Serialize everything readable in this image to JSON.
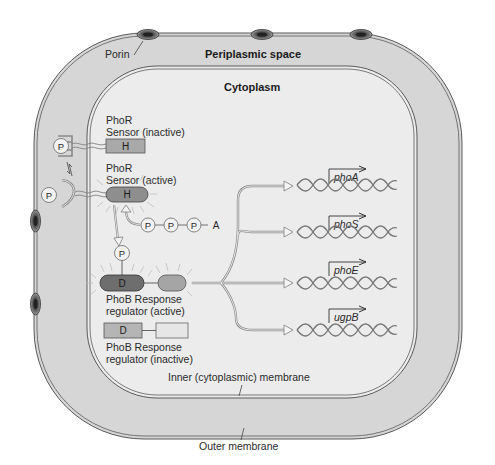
{
  "regions": {
    "periplasm_label": "Periplasmic space",
    "cytoplasm_label": "Cytoplasm",
    "porin_label": "Porin",
    "inner_membrane_label": "Inner (cytoplasmic) membrane",
    "outer_membrane_label": "Outer membrane"
  },
  "sensor_inactive": {
    "line1": "PhoR",
    "line2": "Sensor (inactive)",
    "domain": "H",
    "ligand": "P"
  },
  "sensor_active": {
    "line1": "PhoR",
    "line2": "Sensor (active)",
    "domain": "H",
    "ligand": "P"
  },
  "atp": {
    "p1": "P",
    "p2": "P",
    "p3": "P",
    "a": "A"
  },
  "regulator_active": {
    "phosphate": "P",
    "domain": "D",
    "line1": "PhoB Response",
    "line2": "regulator (active)"
  },
  "regulator_inactive": {
    "domain": "D",
    "line1": "PhoB Response",
    "line2": "regulator (inactive)"
  },
  "genes": [
    {
      "name": "phoA"
    },
    {
      "name": "phoS"
    },
    {
      "name": "phoE"
    },
    {
      "name": "ugpB"
    }
  ],
  "colors": {
    "periplasm": "#d6d6d6",
    "cytoplasm": "#ececec",
    "membrane_line": "#5a5a5a",
    "sensor_inactive_fill": "#a9a9a9",
    "sensor_active_fill": "#8e8e8e",
    "regulator_active_d": "#6e6e6e",
    "regulator_active_c": "#a5a5a5",
    "regulator_inactive_fill": "#b5b5b5",
    "arrow_stroke": "#8a8a8a"
  }
}
